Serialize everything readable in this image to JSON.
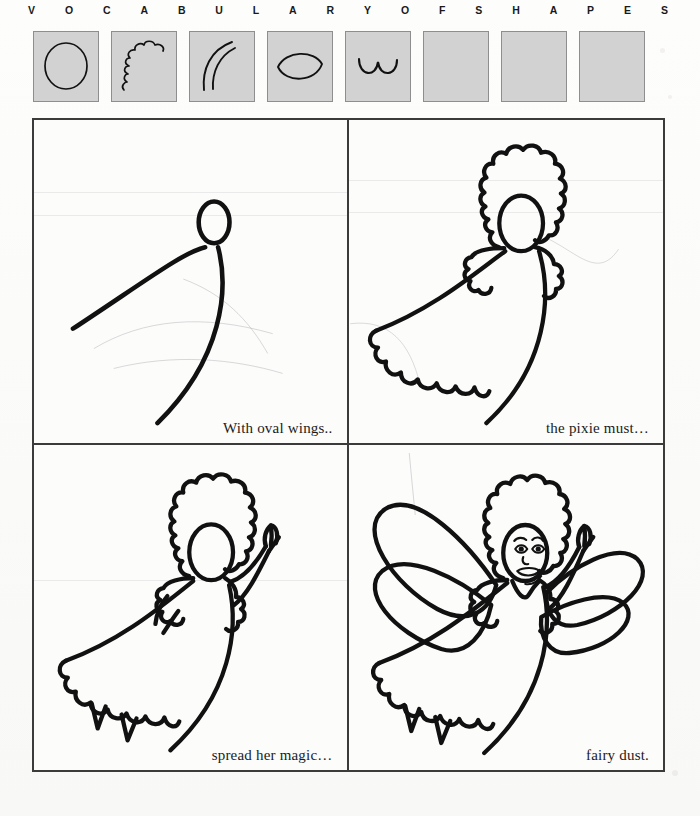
{
  "header": {
    "letters": [
      "V",
      "O",
      "C",
      "A",
      "B",
      "U",
      "L",
      "A",
      "R",
      "Y",
      "O",
      "F",
      "S",
      "H",
      "A",
      "P",
      "E",
      "S"
    ]
  },
  "shape_boxes": [
    {
      "index": 1,
      "icon": "circle-shape-icon",
      "label": "circle",
      "empty": false
    },
    {
      "index": 2,
      "icon": "scalloped-cloud-shape-icon",
      "label": "scalloped cloud",
      "empty": false
    },
    {
      "index": 3,
      "icon": "double-curve-shape-icon",
      "label": "double curve",
      "empty": false
    },
    {
      "index": 4,
      "icon": "lens-oval-shape-icon",
      "label": "pointed oval",
      "empty": false
    },
    {
      "index": 5,
      "icon": "double-scallop-shape-icon",
      "label": "double scallop",
      "empty": false
    },
    {
      "index": 6,
      "icon": "empty-shape-icon",
      "label": "empty",
      "empty": true
    },
    {
      "index": 7,
      "icon": "empty-shape-icon",
      "label": "empty",
      "empty": true
    },
    {
      "index": 8,
      "icon": "empty-shape-icon",
      "label": "empty",
      "empty": true
    }
  ],
  "panels": [
    {
      "step": 1,
      "caption": "With oval wings..",
      "art_name": "pixie-step-1-oval-head-and-body-curves",
      "description": "oval head with two sweeping body curves"
    },
    {
      "step": 2,
      "caption": "the pixie must…",
      "art_name": "pixie-step-2-hair-sleeves-and-scalloped-hem",
      "description": "scalloped hair, puff sleeves and scalloped dress hem added"
    },
    {
      "step": 3,
      "caption": "spread her magic…",
      "art_name": "pixie-step-3-arms-hands-and-feet",
      "description": "raised arm with hand, second arm and feet below hem"
    },
    {
      "step": 4,
      "caption": "fairy dust.",
      "art_name": "pixie-step-4-wings-and-face",
      "description": "four large oval wings and a drawn face complete the fairy"
    }
  ],
  "colors": {
    "ink": "#111111",
    "paper": "#fcfcfb",
    "box_fill": "#d2d2d2",
    "box_border": "#8e8e8e",
    "panel_border": "#3b3b3b"
  }
}
